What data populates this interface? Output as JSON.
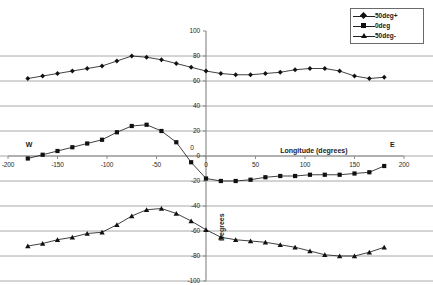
{
  "chart_data": {
    "type": "line",
    "title": "",
    "xlabel": "Longitude (degrees)",
    "ylabel": "Degrees",
    "xlim": [
      -200,
      200
    ],
    "ylim": [
      -100,
      100
    ],
    "grid": true,
    "legend_position": "top-right",
    "xticks": [
      -200,
      -150,
      -100,
      -50,
      0,
      50,
      100,
      150,
      200
    ],
    "xtick_labels": [
      "-200",
      "-150",
      "-100",
      "-50",
      "0",
      "50",
      "100",
      "150",
      "200"
    ],
    "yticks": [
      100,
      80,
      60,
      40,
      20,
      0,
      -20,
      -40,
      -60,
      -80,
      -100
    ],
    "ytick_labels": [
      "100",
      "80",
      "60",
      "40",
      "20",
      "0",
      "-20",
      "-40",
      "-60",
      "-80",
      "-100"
    ],
    "annotations": [
      {
        "text": "W",
        "x": -180,
        "y": 8
      },
      {
        "text": "E",
        "x": 188,
        "y": 8
      },
      {
        "text": "0",
        "x": -14,
        "y": 6
      }
    ],
    "series": [
      {
        "name": "50deg+",
        "marker": "diamond",
        "color": "#111111",
        "x": [
          -180,
          -165,
          -150,
          -135,
          -120,
          -105,
          -90,
          -75,
          -60,
          -45,
          -30,
          -15,
          0,
          15,
          30,
          45,
          60,
          75,
          90,
          105,
          120,
          135,
          150,
          165,
          180
        ],
        "y": [
          62,
          64,
          66,
          68,
          70,
          72,
          76,
          80,
          79,
          77,
          74,
          71,
          68,
          66,
          65,
          65,
          66,
          67,
          69,
          70,
          70,
          68,
          64,
          62,
          63
        ]
      },
      {
        "name": "0deg",
        "marker": "square",
        "color": "#111111",
        "x": [
          -180,
          -165,
          -150,
          -135,
          -120,
          -105,
          -90,
          -75,
          -60,
          -45,
          -30,
          -15,
          0,
          15,
          30,
          45,
          60,
          75,
          90,
          105,
          120,
          135,
          150,
          165,
          180
        ],
        "y": [
          -2,
          1,
          4,
          7,
          10,
          13,
          19,
          24,
          25,
          20,
          11,
          -5,
          -18,
          -20,
          -20,
          -19,
          -17,
          -16,
          -16,
          -15,
          -15,
          -15,
          -14,
          -13,
          -8
        ]
      },
      {
        "name": "50deg-",
        "marker": "triangle",
        "color": "#111111",
        "x": [
          -180,
          -165,
          -150,
          -135,
          -120,
          -105,
          -90,
          -75,
          -60,
          -45,
          -30,
          -15,
          0,
          15,
          30,
          45,
          60,
          75,
          90,
          105,
          120,
          135,
          150,
          165,
          180
        ],
        "y": [
          -72,
          -70,
          -67,
          -65,
          -62,
          -61,
          -55,
          -48,
          -43,
          -42,
          -46,
          -52,
          -59,
          -65,
          -67,
          -68,
          -69,
          -71,
          -73,
          -76,
          -79,
          -80,
          -80,
          -77,
          -73
        ]
      }
    ]
  },
  "legend": {
    "items": [
      {
        "label": "50deg+",
        "marker": "diamond"
      },
      {
        "label": "0deg",
        "marker": "square"
      },
      {
        "label": "50deg-",
        "marker": "triangle"
      }
    ]
  }
}
